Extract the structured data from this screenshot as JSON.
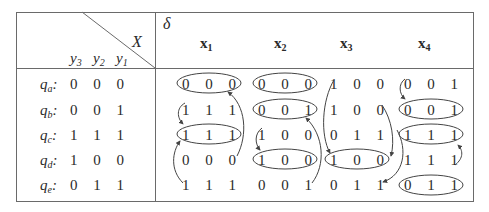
{
  "header": {
    "input_label": "X",
    "delta_label": "δ",
    "state_var_labels": [
      {
        "base": "y",
        "sub": "3"
      },
      {
        "base": "y",
        "sub": "2"
      },
      {
        "base": "y",
        "sub": "1"
      }
    ],
    "input_columns": [
      {
        "base": "x",
        "sub": "1"
      },
      {
        "base": "x",
        "sub": "2"
      },
      {
        "base": "x",
        "sub": "3"
      },
      {
        "base": "x",
        "sub": "4"
      }
    ]
  },
  "rows": [
    {
      "state": "q",
      "state_sub": "a",
      "code": [
        "0",
        "0",
        "0"
      ],
      "next": [
        [
          "0",
          "0",
          "0"
        ],
        [
          "0",
          "0",
          "0"
        ],
        [
          "1",
          "0",
          "0"
        ],
        [
          "0",
          "0",
          "1"
        ]
      ]
    },
    {
      "state": "q",
      "state_sub": "b",
      "code": [
        "0",
        "0",
        "1"
      ],
      "next": [
        [
          "1",
          "1",
          "1"
        ],
        [
          "0",
          "0",
          "1"
        ],
        [
          "1",
          "0",
          "0"
        ],
        [
          "0",
          "0",
          "1"
        ]
      ]
    },
    {
      "state": "q",
      "state_sub": "c",
      "code": [
        "1",
        "1",
        "1"
      ],
      "next": [
        [
          "1",
          "1",
          "1"
        ],
        [
          "1",
          "0",
          "0"
        ],
        [
          "0",
          "1",
          "1"
        ],
        [
          "1",
          "1",
          "1"
        ]
      ]
    },
    {
      "state": "q",
      "state_sub": "d",
      "code": [
        "1",
        "0",
        "0"
      ],
      "next": [
        [
          "0",
          "0",
          "0"
        ],
        [
          "1",
          "0",
          "0"
        ],
        [
          "1",
          "0",
          "0"
        ],
        [
          "1",
          "1",
          "1"
        ]
      ]
    },
    {
      "state": "q",
      "state_sub": "e",
      "code": [
        "0",
        "1",
        "1"
      ],
      "next": [
        [
          "1",
          "1",
          "1"
        ],
        [
          "0",
          "0",
          "1"
        ],
        [
          "0",
          "1",
          "1"
        ],
        [
          "0",
          "1",
          "1"
        ]
      ]
    }
  ],
  "stable_states_circled": {
    "x1": [
      "a",
      "c"
    ],
    "x2": [
      "a",
      "b",
      "d"
    ],
    "x3": [
      "d"
    ],
    "x4": [
      "b",
      "c",
      "e"
    ]
  },
  "colors": {
    "line": "#6a6a6a",
    "text": "#2a2a2a",
    "background": "#ffffff"
  }
}
